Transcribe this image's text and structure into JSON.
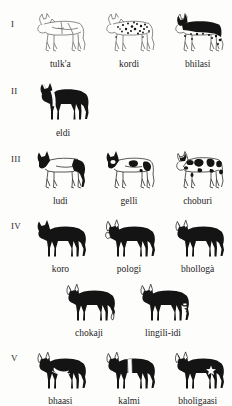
{
  "figure": {
    "groups": [
      {
        "numeral": "I",
        "rows": [
          {
            "indent": false,
            "animals": [
              {
                "label": "tulk'a",
                "pattern": "all-white",
                "body_fill": "#ffffff",
                "outline": "#6b6b6b"
              },
              {
                "label": "kordi",
                "pattern": "white-with-small-black-speckles",
                "body_fill": "#ffffff",
                "outline": "#6b6b6b"
              },
              {
                "label": "bhilasi",
                "pattern": "white-with-large-black-back-patch",
                "body_fill": "#ffffff",
                "outline": "#4a4a4a"
              }
            ]
          }
        ]
      },
      {
        "numeral": "II",
        "rows": [
          {
            "indent": false,
            "animals": [
              {
                "label": "eldi",
                "pattern": "black-with-white-shoulder-band",
                "body_fill": "#111111",
                "outline": "#111111"
              }
            ]
          }
        ]
      },
      {
        "numeral": "III",
        "rows": [
          {
            "indent": false,
            "animals": [
              {
                "label": "ludi",
                "pattern": "white-with-black-head-and-black-hindquarters",
                "body_fill": "#ffffff",
                "outline": "#3a3a3a"
              },
              {
                "label": "gelli",
                "pattern": "white-with-black-head-and-few-black-patches",
                "body_fill": "#ffffff",
                "outline": "#3a3a3a"
              },
              {
                "label": "choburi",
                "pattern": "white-with-many-black-patches",
                "body_fill": "#ffffff",
                "outline": "#3a3a3a"
              }
            ]
          }
        ]
      },
      {
        "numeral": "IV",
        "rows": [
          {
            "indent": false,
            "animals": [
              {
                "label": "koro",
                "pattern": "all-black",
                "body_fill": "#111111",
                "outline": "#111111"
              },
              {
                "label": "pologi",
                "pattern": "black-with-white-horns-and-ears",
                "body_fill": "#111111",
                "outline": "#111111"
              },
              {
                "label": "bhollogà",
                "pattern": "black-with-white-horns",
                "body_fill": "#111111",
                "outline": "#111111"
              }
            ]
          },
          {
            "indent": true,
            "animals": [
              {
                "label": "chokaji",
                "pattern": "black-with-white-tail-tip",
                "body_fill": "#111111",
                "outline": "#111111"
              },
              {
                "label": "lingili-idi",
                "pattern": "black-with-white-hind-leg-markings",
                "body_fill": "#111111",
                "outline": "#111111"
              }
            ]
          }
        ]
      },
      {
        "numeral": "V",
        "rows": [
          {
            "indent": false,
            "animals": [
              {
                "label": "bhaasi",
                "pattern": "black-with-white-belly-crescent",
                "body_fill": "#111111",
                "outline": "#111111"
              },
              {
                "label": "kalmi",
                "pattern": "black-with-white-midsection-belt",
                "body_fill": "#111111",
                "outline": "#111111"
              },
              {
                "label": "bholigaasi",
                "pattern": "black-with-white-flank-star",
                "body_fill": "#111111",
                "outline": "#111111"
              }
            ]
          }
        ]
      }
    ]
  }
}
